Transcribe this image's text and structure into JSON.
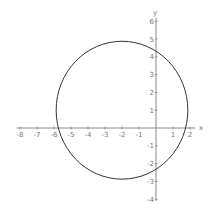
{
  "chart_data": {
    "type": "line",
    "title": "",
    "xlabel": "x",
    "ylabel": "y",
    "xlim": [
      -8.2,
      2.3
    ],
    "ylim": [
      -4.1,
      6.2
    ],
    "grid": false,
    "legend": null,
    "x_ticks": [
      -8,
      -7,
      -6,
      -5,
      -4,
      -3,
      -2,
      -1,
      1,
      2
    ],
    "y_ticks": [
      -4,
      -3,
      -2,
      -1,
      1,
      2,
      3,
      4,
      5,
      6
    ],
    "series": [
      {
        "name": "circle",
        "shape": "circle",
        "equation": "(x+2)^2 + (y-1)^2 = 15",
        "center": [
          -2,
          1
        ],
        "radius": 3.873,
        "color": "#333333"
      }
    ]
  },
  "axes": {
    "x_label": "x",
    "y_label": "y",
    "x_tick_labels": [
      "-8",
      "-7",
      "-6",
      "-5",
      "-4",
      "-3",
      "-2",
      "-1",
      "1",
      "2"
    ],
    "y_tick_labels": [
      "-4",
      "-3",
      "-2",
      "-1",
      "1",
      "2",
      "3",
      "4",
      "5",
      "6"
    ]
  }
}
